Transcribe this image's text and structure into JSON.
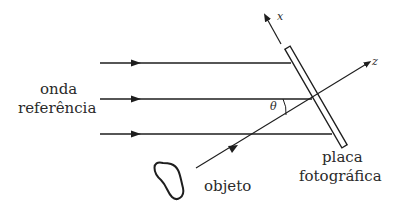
{
  "diagram": {
    "labels": {
      "reference_wave_line1": "onda",
      "reference_wave_line2": "referência",
      "axis_x": "x",
      "axis_z": "z",
      "angle": "θ",
      "plate_line1": "placa",
      "plate_line2": "fotográfica",
      "object": "objeto"
    },
    "colors": {
      "stroke": "#1e1e1e",
      "text": "#2a2a2a",
      "background": "#ffffff"
    }
  }
}
